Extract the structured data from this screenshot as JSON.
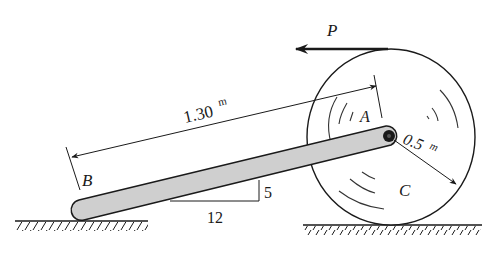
{
  "diagram": {
    "type": "engineering mechanics figure",
    "labels": {
      "force": "P",
      "point_a": "A",
      "point_b": "B",
      "point_c": "C",
      "length_value": "1.30",
      "length_unit": "m",
      "radius_value": "0.5",
      "radius_unit": "m",
      "slope_rise": "5",
      "slope_run": "12"
    },
    "colors": {
      "ink": "#1a1a1a",
      "rod_fill": "#cfcfcf",
      "background": "#ffffff"
    }
  }
}
